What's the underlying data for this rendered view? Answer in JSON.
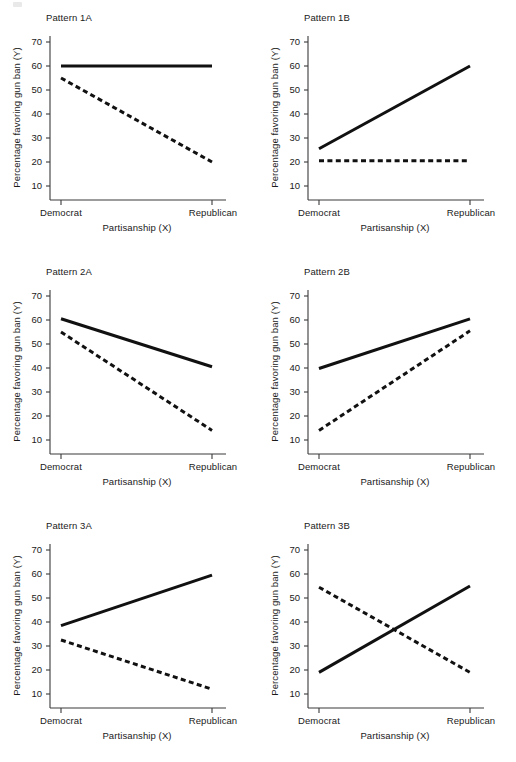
{
  "figure": {
    "panel_count": 6,
    "line_color": "#111111",
    "axis_color": "#3a3a3a",
    "background": "#ffffff"
  },
  "axes": {
    "ylabel": "Percentage favoring gun ban (Y)",
    "xlabel": "Partisanship (X)",
    "yticks": [
      70,
      60,
      50,
      40,
      30,
      20,
      10
    ],
    "ytick_labels": [
      "70",
      "60",
      "50",
      "40",
      "30",
      "20",
      "10"
    ],
    "xtick_labels": [
      "Democrat",
      "Republican"
    ],
    "ylim": [
      5,
      75
    ],
    "grid": "off",
    "legend": "none"
  },
  "chart_data": [
    {
      "type": "line",
      "title": "Pattern 1A",
      "xlabel": "Partisanship (X)",
      "ylabel": "Percentage favoring gun ban (Y)",
      "categories": [
        "Democrat",
        "Republican"
      ],
      "ylim": [
        5,
        75
      ],
      "yticks": [
        10,
        20,
        30,
        40,
        50,
        60,
        70
      ],
      "grid": "off",
      "series": [
        {
          "name": "solid",
          "style": "solid",
          "values": [
            60,
            60
          ]
        },
        {
          "name": "dashed",
          "style": "dashed",
          "values": [
            55,
            20
          ]
        }
      ]
    },
    {
      "type": "line",
      "title": "Pattern 1B",
      "xlabel": "Partisanship (X)",
      "ylabel": "Percentage favoring gun ban (Y)",
      "categories": [
        "Democrat",
        "Republican"
      ],
      "ylim": [
        5,
        75
      ],
      "yticks": [
        10,
        20,
        30,
        40,
        50,
        60,
        70
      ],
      "grid": "off",
      "series": [
        {
          "name": "solid",
          "style": "solid",
          "values": [
            25.5,
            60
          ]
        },
        {
          "name": "dashed",
          "style": "dashed",
          "values": [
            20.5,
            20.5
          ]
        }
      ]
    },
    {
      "type": "line",
      "title": "Pattern 2A",
      "xlabel": "Partisanship (X)",
      "ylabel": "Percentage favoring gun ban (Y)",
      "categories": [
        "Democrat",
        "Republican"
      ],
      "ylim": [
        5,
        75
      ],
      "yticks": [
        10,
        20,
        30,
        40,
        50,
        60,
        70
      ],
      "grid": "off",
      "series": [
        {
          "name": "solid",
          "style": "solid",
          "values": [
            60.5,
            40.5
          ]
        },
        {
          "name": "dashed",
          "style": "dashed",
          "values": [
            55,
            14
          ]
        }
      ]
    },
    {
      "type": "line",
      "title": "Pattern 2B",
      "xlabel": "Partisanship (X)",
      "ylabel": "Percentage favoring gun ban (Y)",
      "categories": [
        "Democrat",
        "Republican"
      ],
      "ylim": [
        5,
        75
      ],
      "yticks": [
        10,
        20,
        30,
        40,
        50,
        60,
        70
      ],
      "grid": "off",
      "series": [
        {
          "name": "solid",
          "style": "solid",
          "values": [
            39.8,
            60.5
          ]
        },
        {
          "name": "dashed",
          "style": "dashed",
          "values": [
            14,
            55.5
          ]
        }
      ]
    },
    {
      "type": "line",
      "title": "Pattern 3A",
      "xlabel": "Partisanship (X)",
      "ylabel": "Percentage favoring gun ban (Y)",
      "categories": [
        "Democrat",
        "Republican"
      ],
      "ylim": [
        5,
        75
      ],
      "yticks": [
        10,
        20,
        30,
        40,
        50,
        60,
        70
      ],
      "grid": "off",
      "series": [
        {
          "name": "solid",
          "style": "solid",
          "values": [
            38.5,
            59.5
          ]
        },
        {
          "name": "dashed",
          "style": "dashed",
          "values": [
            32.5,
            12
          ]
        }
      ]
    },
    {
      "type": "line",
      "title": "Pattern 3B",
      "xlabel": "Partisanship (X)",
      "ylabel": "Percentage favoring gun ban (Y)",
      "categories": [
        "Democrat",
        "Republican"
      ],
      "ylim": [
        5,
        75
      ],
      "yticks": [
        10,
        20,
        30,
        40,
        50,
        60,
        70
      ],
      "grid": "off",
      "series": [
        {
          "name": "solid",
          "style": "solid",
          "values": [
            19,
            55
          ]
        },
        {
          "name": "dashed",
          "style": "dashed",
          "values": [
            54.5,
            19
          ]
        }
      ]
    }
  ]
}
